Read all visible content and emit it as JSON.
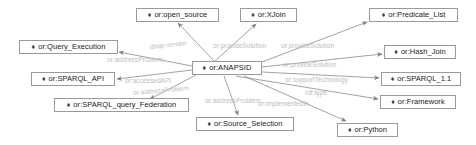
{
  "diagram": {
    "type": "node-link-graph",
    "node_glyph": "icon-diamond-bullet",
    "colors": {
      "node_border": "#9a9a9a",
      "node_fill": "#ffffff",
      "node_text": "#1a1a1a",
      "edge_line": "#8a8a8a",
      "edge_label_text": "#bdbdbd",
      "background": "#ffffff"
    },
    "nodes": [
      {
        "id": "open_source",
        "label": "or:open_source",
        "x": 136,
        "y": 8,
        "w": 83
      },
      {
        "id": "xjoin",
        "label": "or:XJoin",
        "x": 240,
        "y": 8,
        "w": 57
      },
      {
        "id": "predicate_list",
        "label": "or:Predicate_List",
        "x": 369,
        "y": 8,
        "w": 89
      },
      {
        "id": "query_execution",
        "label": "or:Query_Execution",
        "x": 19,
        "y": 40,
        "w": 99
      },
      {
        "id": "hash_join",
        "label": "or:Hash_Join",
        "x": 384,
        "y": 45,
        "w": 72
      },
      {
        "id": "sparql_api",
        "label": "or:SPARQL_API",
        "x": 31,
        "y": 72,
        "w": 84
      },
      {
        "id": "anapsid",
        "label": "or:ANAPSID",
        "x": 192,
        "y": 61,
        "w": 70
      },
      {
        "id": "sparql_1_1",
        "label": "or:SPARQL_1.1",
        "x": 381,
        "y": 72,
        "w": 80
      },
      {
        "id": "framework",
        "label": "or:Framework",
        "x": 380,
        "y": 95,
        "w": 76
      },
      {
        "id": "sparql_query_federation",
        "label": "or:SPARQL_query_Federation",
        "x": 54,
        "y": 98,
        "w": 135
      },
      {
        "id": "source_selection",
        "label": "or:Source_Selection",
        "x": 196,
        "y": 117,
        "w": 98
      },
      {
        "id": "python",
        "label": "or:Python",
        "x": 337,
        "y": 123,
        "w": 61
      }
    ],
    "edges": [
      {
        "from": "anapsid",
        "to": "open_source",
        "label": "doap:vendor",
        "label_x": 150,
        "label_y": 44,
        "rotate": -6
      },
      {
        "from": "anapsid",
        "to": "query_execution",
        "label": "or:addressProblem",
        "label_x": 107,
        "label_y": 57,
        "rotate": 0
      },
      {
        "from": "anapsid",
        "to": "sparql_api",
        "label": "or:accessedAPI",
        "label_x": 125,
        "label_y": 78,
        "rotate": 0
      },
      {
        "from": "anapsid",
        "to": "sparql_query_federation",
        "label": "or:addressProblem",
        "label_x": 133,
        "label_y": 90,
        "rotate": -5
      },
      {
        "from": "anapsid",
        "to": "xjoin",
        "label": "or:provideSolution",
        "label_x": 213,
        "label_y": 43,
        "rotate": 0
      },
      {
        "from": "anapsid",
        "to": "predicate_list",
        "label": "or:provideSolution",
        "label_x": 281,
        "label_y": 43,
        "rotate": 0
      },
      {
        "from": "anapsid",
        "to": "hash_join",
        "label": "or:provideSolution",
        "label_x": 283,
        "label_y": 62,
        "rotate": 0
      },
      {
        "from": "anapsid",
        "to": "sparql_1_1",
        "label": "or:supportTechnology",
        "label_x": 285,
        "label_y": 77,
        "rotate": 0
      },
      {
        "from": "anapsid",
        "to": "framework",
        "label": "rdf:type",
        "label_x": 305,
        "label_y": 90,
        "rotate": 0
      },
      {
        "from": "anapsid",
        "to": "source_selection",
        "label": "or:addressProblem",
        "label_x": 205,
        "label_y": 98,
        "rotate": 0
      },
      {
        "from": "anapsid",
        "to": "python",
        "label": "or:implementedIn",
        "label_x": 258,
        "label_y": 101,
        "rotate": 0
      }
    ]
  }
}
